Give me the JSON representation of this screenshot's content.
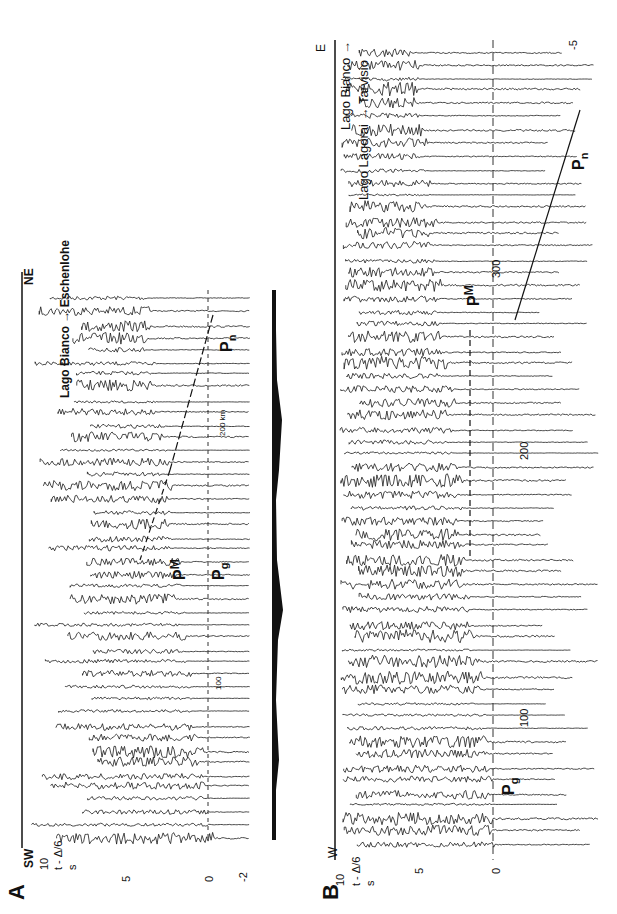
{
  "figure": {
    "panel_a": {
      "letter": "A",
      "dir_start": "SW",
      "dir_end": "NE",
      "axis_label_top": "10",
      "axis_label_formula": "t - Δ/6",
      "axis_label_unit": "s",
      "time_ticks": [
        "5",
        "0",
        "-2"
      ],
      "profile_title": "Lago Bianco → Eschenlohe",
      "distance_labels": [
        "100",
        "200 km"
      ],
      "phases": [
        {
          "name": "P",
          "sub": "n"
        },
        {
          "name": "P",
          "sup": "M"
        },
        {
          "name": "P",
          "sub": "g"
        }
      ],
      "topo_left": "km",
      "topo_right": "km"
    },
    "panel_b": {
      "letter": "B",
      "dir_start": "W",
      "dir_end": "E",
      "axis_label_top": "10",
      "axis_label_formula": "t - Δ/6",
      "axis_label_unit": "s",
      "time_ticks": [
        "5",
        "0",
        "-5"
      ],
      "profile_line1": "Lago Bianco →",
      "profile_line2": "Lago Lagorai → Tarvisio",
      "distance_labels": [
        "100",
        "200",
        "300"
      ],
      "phases": [
        {
          "name": "P",
          "sub": "g"
        },
        {
          "name": "P",
          "sup": "M"
        },
        {
          "name": "P",
          "sub": "n"
        }
      ]
    }
  }
}
